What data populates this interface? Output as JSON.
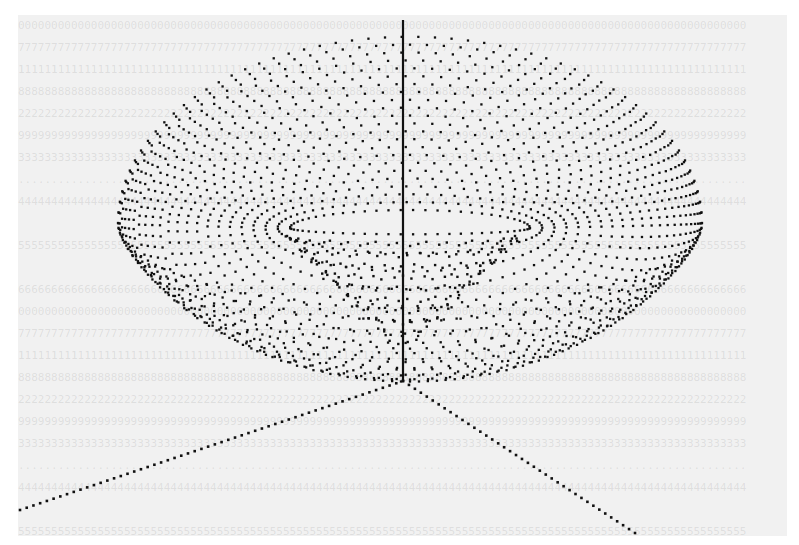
{
  "figure": {
    "background_color": "#f1f1f1",
    "dot_color": "#111111",
    "axes": {
      "origin": [
        403,
        381
      ],
      "vertical_end": [
        403,
        20
      ],
      "left_end": [
        20,
        510
      ],
      "right_end": [
        635,
        533
      ],
      "vertical_style": "solid",
      "horizontal_style": "dotted"
    },
    "surface": {
      "shape": "torus-bowl",
      "center": [
        410,
        228
      ],
      "outer_rim": {
        "rx": 292,
        "ry": 190,
        "top_y": 43
      },
      "inner_hole": {
        "rx": 120,
        "ry": 18
      },
      "funnel_bottom": [
        403,
        350
      ],
      "rings": 22,
      "points_per_ring": 110
    }
  },
  "bleed_through_text": "illegible reversed table text showing through from the back of the page"
}
